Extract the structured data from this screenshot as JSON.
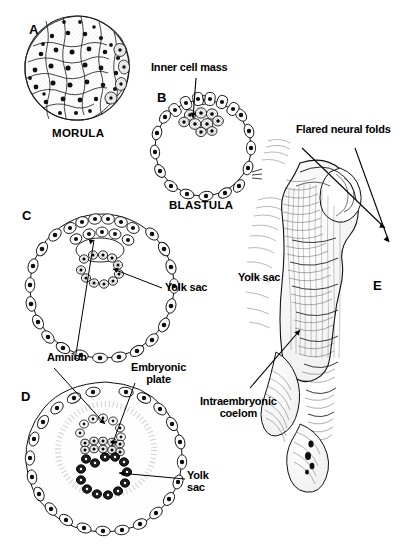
{
  "figure": {
    "background_color": "#ffffff",
    "ink_color": "#000000",
    "width": 405,
    "height": 559
  },
  "panels": [
    {
      "letter": "A",
      "name": "morula",
      "caption": "MORULA",
      "description": "Solid ball of blastomere cells, each with a dark nucleus"
    },
    {
      "letter": "B",
      "name": "blastula",
      "caption": "BLASTULA",
      "description": "Hollow sphere of trophoblast cells with a shaded inner cell mass at the top"
    },
    {
      "letter": "C",
      "name": "bilaminar-germ-disc",
      "caption": "",
      "description": "Blastocyst with amniotic cavity and primary yolk sac inside"
    },
    {
      "letter": "D",
      "name": "trilaminar-embryo",
      "caption": "",
      "description": "Chorionic vesicle with amnion, embryonic plate and yolk sac"
    },
    {
      "letter": "E",
      "name": "neural-fold-embryo",
      "caption": "",
      "description": "Shaded drawing of an embryo showing flared neural folds and coelom"
    }
  ],
  "labels": [
    {
      "id": "inner-cell-mass",
      "text": "Inner cell mass",
      "panel": "B"
    },
    {
      "id": "yolk-sac-c",
      "text": "Yolk sac",
      "panel": "C"
    },
    {
      "id": "amnion",
      "text": "Amnion",
      "panel": "C"
    },
    {
      "id": "embryonic-plate",
      "text": "Embryonic\nplate",
      "panel": "D"
    },
    {
      "id": "yolk-sac-d",
      "text": "Yolk\nsac",
      "panel": "D"
    },
    {
      "id": "flared-neural-folds",
      "text": "Flared neural folds",
      "panel": "E"
    },
    {
      "id": "yolk-sac-e",
      "text": "Yolk sac",
      "panel": "E"
    },
    {
      "id": "intraembryonic-coelom",
      "text": "Intraembryonic\ncoelom",
      "panel": "E"
    }
  ]
}
